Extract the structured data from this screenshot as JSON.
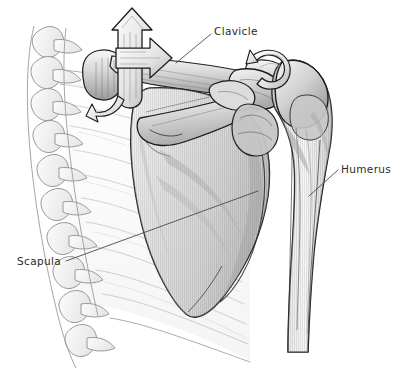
{
  "figure": {
    "view": "anterior view of right shoulder",
    "background_color": "#ffffff",
    "width": 400,
    "height": 372,
    "style": "grayscale pen-and-ink medical illustration with hatched shading"
  },
  "labels": [
    {
      "id": "clavicle",
      "text": "Clavicle",
      "x": 214,
      "y": 25,
      "leader_from": [
        211,
        34
      ],
      "leader_to": [
        176,
        63
      ]
    },
    {
      "id": "humerus",
      "text": "Humerus",
      "x": 341,
      "y": 163,
      "leader_from": [
        338,
        170
      ],
      "leader_to": [
        309,
        196
      ]
    },
    {
      "id": "scapula",
      "text": "Scapula",
      "x": 17,
      "y": 255,
      "leader_from": [
        66,
        261
      ],
      "leader_to": [
        258,
        191
      ]
    }
  ],
  "structures": {
    "clavicle": "Clavicle",
    "humerus": "Humerus",
    "scapula": "Scapula",
    "acromion": "Acromion",
    "coracoid_process": "Coracoid process",
    "spine_of_scapula": "Spine of scapula",
    "glenoid": "Glenoid fossa",
    "greater_tuberosity": "Greater tuberosity",
    "inferior_angle": "Inferior angle of scapula",
    "ribs": "Ribs",
    "vertebrae": "Thoracic vertebrae",
    "sternoclavicular_joint": "Sternoclavicular joint",
    "acromioclavicular_joint": "Acromioclavicular joint"
  },
  "motion_arrows": [
    {
      "id": "elevation-arrow",
      "description": "large outlined arrow pointing superiorly at the medial clavicle",
      "direction": "up"
    },
    {
      "id": "protraction-arrow",
      "description": "outlined arrow pointing laterally to the right along the clavicle",
      "direction": "right"
    },
    {
      "id": "rotation-arrow",
      "description": "curved outlined rotation arrow at the acromioclavicular joint",
      "direction": "rotation"
    }
  ],
  "colors": {
    "outline": "#1c1c1c",
    "bone_light": "#f2f2f2",
    "bone_mid": "#cfcfcf",
    "bone_dark": "#9a9a9a",
    "bone_shadow": "#6e6e6e",
    "faint_line": "#9d9d9d",
    "label_text": "#2b2b2b",
    "leader_line": "#4a4a4a",
    "background": "#ffffff"
  }
}
